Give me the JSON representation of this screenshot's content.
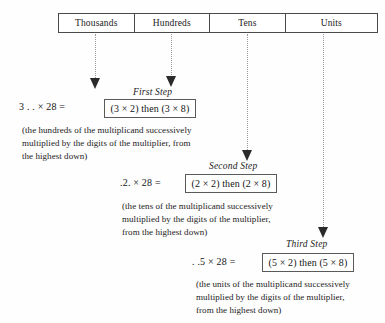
{
  "table": {
    "columns": [
      {
        "label": "Thousands"
      },
      {
        "label": "Hundreds"
      },
      {
        "label": "Tens"
      },
      {
        "label": "Units"
      }
    ]
  },
  "steps": [
    {
      "label": "First Step",
      "equation": "3 . . ×  28 =",
      "box": "(3 × 2) then (3 × 8)",
      "note_lines": [
        "(the hundreds of the multiplicand successively",
        "multiplied by the digits of the multiplier, from",
        "the highest down)"
      ]
    },
    {
      "label": "Second Step",
      "equation": ".2. × 28 =",
      "box": "(2 × 2) then (2 × 8)",
      "note_lines": [
        "(the tens of the multiplicand successively",
        "multiplied by the digits of the multiplier,",
        "from the highest down)"
      ]
    },
    {
      "label": "Third Step",
      "equation": ". .5 × 28 =",
      "box": "(5 × 2) then (5 × 8)",
      "note_lines": [
        "(the units of the multiplicand successively",
        "multiplied by the digits of the multiplier,",
        "from the highest down)"
      ]
    }
  ],
  "colors": {
    "ink": "#1a1a1a",
    "rule": "#4a4a4a",
    "dotted": "#9a9a9a",
    "page": "#fefefe"
  }
}
